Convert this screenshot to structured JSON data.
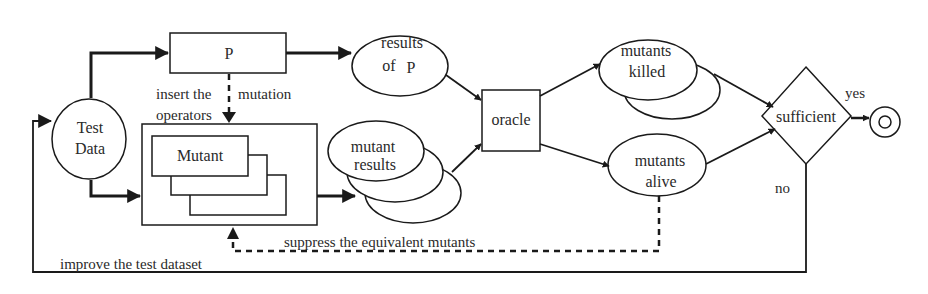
{
  "diagram": {
    "colors": {
      "stroke": "#1a1a1a",
      "text": "#2a2a2a",
      "background": "#ffffff"
    },
    "nodes": {
      "test_data": {
        "line1": "Test",
        "line2": "Data",
        "shape": "ellipse"
      },
      "program": {
        "label": "P",
        "shape": "rectangle"
      },
      "mutant": {
        "label": "Mutant",
        "shape": "stacked-rectangles"
      },
      "results_of_p": {
        "line1": "results",
        "line2": "of",
        "line2b": "P",
        "shape": "ellipse"
      },
      "mutant_results": {
        "line1": "mutant",
        "line2": "results",
        "shape": "stacked-ellipses"
      },
      "oracle": {
        "label": "oracle",
        "shape": "rectangle"
      },
      "mutants_killed": {
        "line1": "mutants",
        "line2": "killed",
        "shape": "stacked-ellipses"
      },
      "mutants_alive": {
        "line1": "mutants",
        "line2": "alive",
        "shape": "ellipse"
      },
      "sufficient": {
        "label": "sufficient",
        "shape": "diamond"
      },
      "end": {
        "label": "",
        "shape": "end-state"
      }
    },
    "edge_labels": {
      "insert_the": "insert the",
      "operators": "operators",
      "mutation": "mutation",
      "suppress": "suppress the equivalent mutants",
      "improve": "improve the test dataset",
      "yes": "yes",
      "no": "no"
    }
  }
}
